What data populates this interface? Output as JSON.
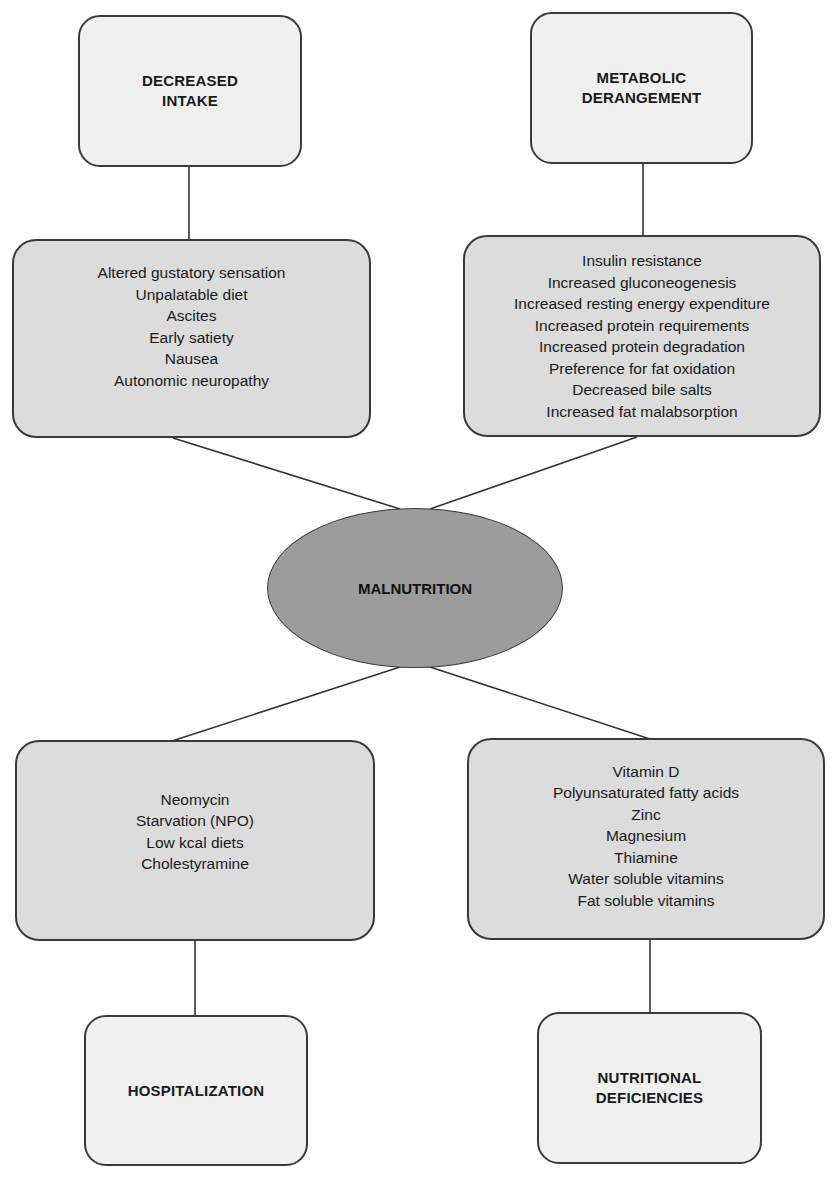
{
  "diagram": {
    "center": {
      "label": "MALNUTRITION"
    },
    "categories": {
      "decreased_intake": {
        "title_lines": [
          "DECREASED",
          "INTAKE"
        ],
        "items": [
          "Altered gustatory sensation",
          "Unpalatable diet",
          "Ascites",
          "Early satiety",
          "Nausea",
          "Autonomic neuropathy"
        ]
      },
      "metabolic_derangement": {
        "title_lines": [
          "METABOLIC",
          "DERANGEMENT"
        ],
        "items": [
          "Insulin resistance",
          "Increased gluconeogenesis",
          "Increased resting energy expenditure",
          "Increased protein requirements",
          "Increased protein degradation",
          "Preference for fat oxidation",
          "Decreased bile salts",
          "Increased fat malabsorption"
        ]
      },
      "hospitalization": {
        "title_lines": [
          "HOSPITALIZATION"
        ],
        "items": [
          "Neomycin",
          "Starvation (NPO)",
          "Low kcal diets",
          "Cholestyramine"
        ]
      },
      "nutritional_deficiencies": {
        "title_lines": [
          "NUTRITIONAL",
          "DEFICIENCIES"
        ],
        "items": [
          "Vitamin D",
          "Polyunsaturated fatty acids",
          "Zinc",
          "Magnesium",
          "Thiamine",
          "Water soluble vitamins",
          "Fat soluble vitamins"
        ]
      }
    },
    "colors": {
      "header_fill": "#f0f0f0",
      "detail_fill": "#dcdcdc",
      "center_fill": "#9c9c9c",
      "stroke": "#3a3a3a"
    }
  }
}
